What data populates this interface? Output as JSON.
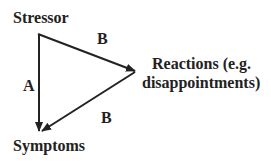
{
  "nodes": {
    "stressor": "Stressor",
    "reactions_line1": "Reactions (e.g.",
    "reactions_line2": "disappointments)",
    "symptoms": "Symptoms"
  },
  "edges": {
    "stressor_to_symptoms": "A",
    "stressor_to_reactions": "B",
    "reactions_to_symptoms": "B"
  },
  "colors": {
    "line": "#222222",
    "text": "#222222"
  }
}
